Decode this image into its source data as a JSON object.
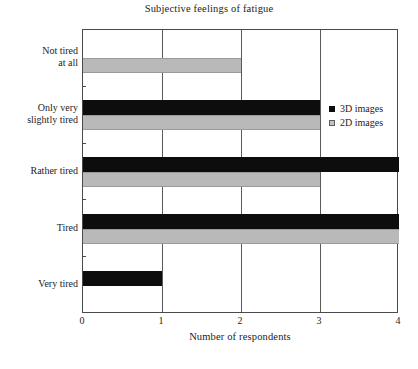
{
  "chart_data": {
    "type": "bar",
    "orientation": "horizontal",
    "title": "Subjective feelings of fatigue",
    "xlabel": "Number of respondents",
    "ylabel": "",
    "xlim": [
      0,
      4
    ],
    "xticks": [
      "0",
      "1",
      "2",
      "3",
      "4"
    ],
    "grid": "vertical",
    "legend_position": "upper right inside",
    "categories": [
      "Not tired\nat all",
      "Only very\nslightly tired",
      "Rather tired",
      "Tired",
      "Very tired"
    ],
    "category_lines": [
      [
        "Not tired",
        "at all"
      ],
      [
        "Only very",
        "slightly tired"
      ],
      [
        "Rather tired"
      ],
      [
        "Tired"
      ],
      [
        "Very tired"
      ]
    ],
    "series": [
      {
        "name": "3D images",
        "color": "#0d0d0d",
        "values": [
          0,
          3,
          4,
          4,
          1
        ]
      },
      {
        "name": "2D images",
        "color": "#b9b9b9",
        "values": [
          2,
          3,
          3,
          4,
          0
        ]
      }
    ]
  },
  "legend": {
    "items": [
      {
        "label": "3D images"
      },
      {
        "label": "2D images"
      }
    ]
  },
  "colors": {
    "series_3d": "#0d0d0d",
    "series_2d": "#b9b9b9",
    "axis": "#4a4a4a",
    "grid": "#5a5a5a",
    "text": "#1c1c1c",
    "background": "#ffffff"
  },
  "artifact": {
    "bottom_text": ""
  }
}
